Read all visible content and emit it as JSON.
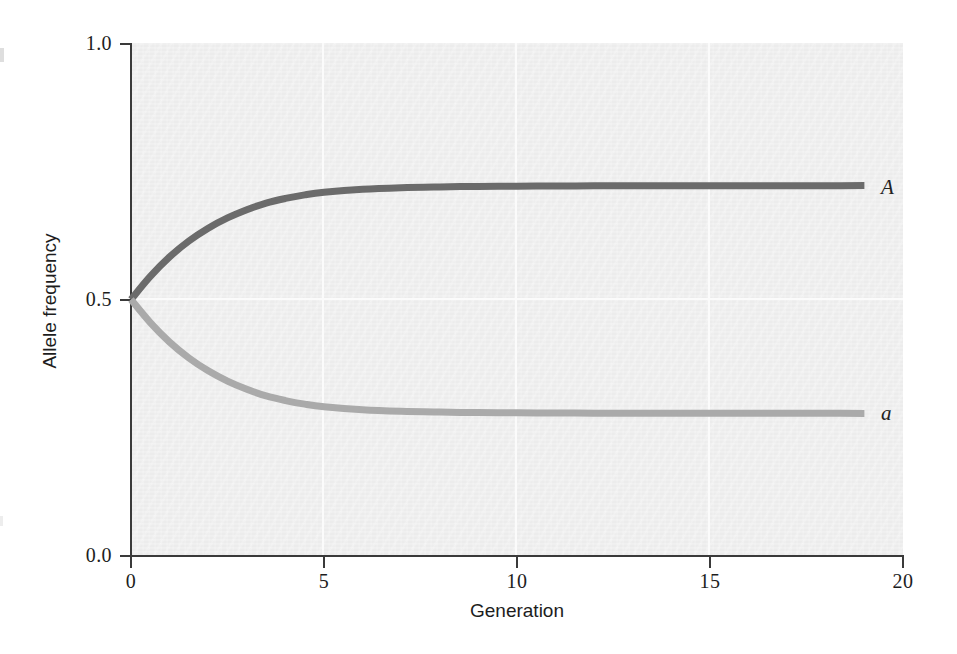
{
  "chart_data": {
    "type": "line",
    "title": "",
    "subtitle": "",
    "xlabel": "Generation",
    "ylabel": "Allele frequency",
    "xlim": [
      0,
      20
    ],
    "ylim": [
      0.0,
      1.0
    ],
    "xticks": [
      "0",
      "5",
      "10",
      "15",
      "20"
    ],
    "xtick_values": [
      0,
      5,
      10,
      15,
      20
    ],
    "yticks": [
      "0.0",
      "0.5",
      "1.0"
    ],
    "ytick_values": [
      0.0,
      0.5,
      1.0
    ],
    "grid": "white gridlines at x = 5, 10, 15 and y = 0.5",
    "legend_position": "right-of-curve-ends (inline labels)",
    "x": [
      0,
      0.5,
      1,
      1.5,
      2,
      2.5,
      3,
      3.5,
      4,
      4.5,
      5,
      6,
      7,
      8,
      9,
      10,
      11,
      12,
      13,
      14,
      15,
      16,
      17,
      18,
      19
    ],
    "series": [
      {
        "name": "A",
        "label": "A",
        "color": "#6b6b6b",
        "values": [
          0.5,
          0.545,
          0.583,
          0.614,
          0.639,
          0.659,
          0.675,
          0.688,
          0.697,
          0.704,
          0.709,
          0.715,
          0.718,
          0.7195,
          0.7205,
          0.721,
          0.7213,
          0.7215,
          0.7216,
          0.7217,
          0.7218,
          0.7218,
          0.7219,
          0.7219,
          0.722
        ]
      },
      {
        "name": "a",
        "label": "a",
        "color": "#aaaaaa",
        "values": [
          0.5,
          0.455,
          0.417,
          0.386,
          0.361,
          0.341,
          0.325,
          0.312,
          0.303,
          0.296,
          0.291,
          0.285,
          0.282,
          0.2805,
          0.2795,
          0.279,
          0.2787,
          0.2785,
          0.2784,
          0.2783,
          0.2782,
          0.2782,
          0.2781,
          0.2781,
          0.278
        ]
      }
    ]
  },
  "axes": {
    "y_title": "Allele frequency",
    "x_title": "Generation",
    "y_tick_labels": [
      "1.0",
      "0.5",
      "0.0"
    ],
    "x_tick_labels": [
      "0",
      "5",
      "10",
      "15",
      "20"
    ]
  },
  "series_labels": {
    "upper": "A",
    "lower": "a"
  },
  "colors": {
    "panel_background": "#ececec",
    "page_background": "#ffffff",
    "axis": "#3a3a3a",
    "gridline": "#fbfbfb",
    "curve_A": "#6b6b6b",
    "curve_a": "#aaaaaa",
    "text": "#1d1d1d"
  }
}
